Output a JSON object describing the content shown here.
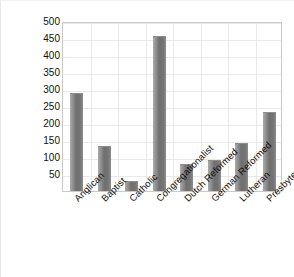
{
  "chart_data": {
    "type": "bar",
    "title": "",
    "subtitle": "",
    "xlabel": "",
    "ylabel": "Number of Churches",
    "categories": [
      "Anglican",
      "Baptist",
      "Catholic",
      "Congregationalist",
      "Dutch Reformed",
      "German Reformed",
      "Lutheran",
      "Presbyterian"
    ],
    "values": [
      288,
      133,
      30,
      455,
      80,
      92,
      140,
      232
    ],
    "ylim": [
      0,
      500
    ],
    "yticks": [
      50,
      100,
      150,
      200,
      250,
      300,
      350,
      400,
      450,
      500
    ],
    "ytick_labels": [
      "50",
      "100",
      "150",
      "200",
      "250",
      "300",
      "350",
      "400",
      "450",
      "500"
    ],
    "grid": {
      "horizontal": true,
      "vertical": true
    },
    "legend": {
      "visible": false,
      "position": "none"
    },
    "series": [
      {
        "name": "Number of Churches",
        "values": [
          288,
          133,
          30,
          455,
          80,
          92,
          140,
          232
        ],
        "color": "#7a7a7a"
      }
    ],
    "colors": {
      "bar_fill": "#7a7a7a",
      "bar_highlight": "#a9a9a9",
      "plot_background": "#ffffff",
      "grid_color": "#e9e9e9",
      "axis_border": "#c9c9c9",
      "text": "#111111"
    },
    "annotations": []
  }
}
